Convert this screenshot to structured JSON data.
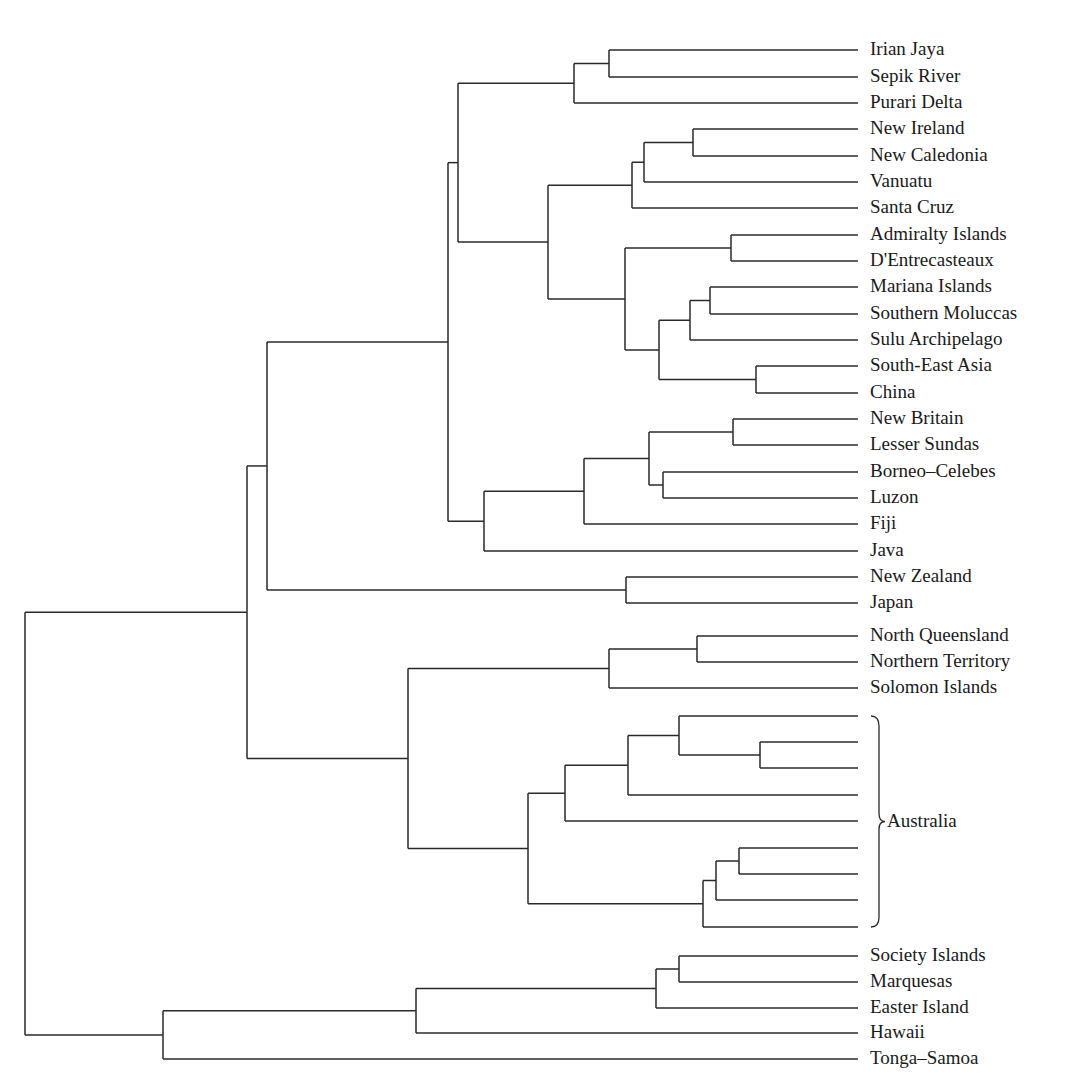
{
  "chart_data": {
    "type": "dendrogram",
    "title": "",
    "orientation": "leaves-right",
    "line_color": "#2a2a2a",
    "leaf_x": 858,
    "label_x": 870,
    "leaves": [
      {
        "id": "irian",
        "label": "Irian Jaya",
        "y": 50
      },
      {
        "id": "sepik",
        "label": "Sepik River",
        "y": 77
      },
      {
        "id": "purari",
        "label": "Purari Delta",
        "y": 103
      },
      {
        "id": "newireland",
        "label": "New Ireland",
        "y": 129
      },
      {
        "id": "newcaledonia",
        "label": "New Caledonia",
        "y": 156
      },
      {
        "id": "vanuatu",
        "label": "Vanuatu",
        "y": 182
      },
      {
        "id": "santacruz",
        "label": "Santa Cruz",
        "y": 208
      },
      {
        "id": "admiralty",
        "label": "Admiralty Islands",
        "y": 235
      },
      {
        "id": "dentre",
        "label": "D'Entrecasteaux",
        "y": 261
      },
      {
        "id": "mariana",
        "label": "Mariana Islands",
        "y": 287
      },
      {
        "id": "smoluccas",
        "label": "Southern Moluccas",
        "y": 314
      },
      {
        "id": "sulu",
        "label": "Sulu Archipelago",
        "y": 340
      },
      {
        "id": "seasia",
        "label": "South-East Asia",
        "y": 366
      },
      {
        "id": "china",
        "label": "China",
        "y": 393
      },
      {
        "id": "newbritain",
        "label": "New Britain",
        "y": 419
      },
      {
        "id": "lsundas",
        "label": "Lesser Sundas",
        "y": 445
      },
      {
        "id": "borneo",
        "label": "Borneo–Celebes",
        "y": 472
      },
      {
        "id": "luzon",
        "label": "Luzon",
        "y": 498
      },
      {
        "id": "fiji",
        "label": "Fiji",
        "y": 524
      },
      {
        "id": "java",
        "label": "Java",
        "y": 551
      },
      {
        "id": "nz",
        "label": "New Zealand",
        "y": 577
      },
      {
        "id": "japan",
        "label": "Japan",
        "y": 603
      },
      {
        "id": "nqld",
        "label": "North Queensland",
        "y": 636
      },
      {
        "id": "nt",
        "label": "Northern Territory",
        "y": 662
      },
      {
        "id": "solomon",
        "label": "Solomon Islands",
        "y": 688
      },
      {
        "id": "au1",
        "label": "",
        "y": 716
      },
      {
        "id": "au2",
        "label": "",
        "y": 742
      },
      {
        "id": "au3",
        "label": "",
        "y": 768
      },
      {
        "id": "au4",
        "label": "",
        "y": 795
      },
      {
        "id": "au5",
        "label": "",
        "y": 821
      },
      {
        "id": "au6",
        "label": "",
        "y": 848
      },
      {
        "id": "au7",
        "label": "",
        "y": 874
      },
      {
        "id": "au8",
        "label": "",
        "y": 900
      },
      {
        "id": "au9",
        "label": "",
        "y": 927
      },
      {
        "id": "society",
        "label": "Society Islands",
        "y": 956
      },
      {
        "id": "marquesas",
        "label": "Marquesas",
        "y": 982
      },
      {
        "id": "easter",
        "label": "Easter Island",
        "y": 1008
      },
      {
        "id": "hawaii",
        "label": "Hawaii",
        "y": 1033
      },
      {
        "id": "tonga",
        "label": "Tonga–Samoa",
        "y": 1059
      }
    ],
    "nodes": [
      {
        "id": "n_irian_sepik",
        "x": 609,
        "children": [
          "irian",
          "sepik"
        ]
      },
      {
        "id": "n_png",
        "x": 574,
        "children": [
          "n_irian_sepik",
          "purari"
        ]
      },
      {
        "id": "n_ni_nc",
        "x": 693,
        "children": [
          "newireland",
          "newcaledonia"
        ]
      },
      {
        "id": "n_van",
        "x": 644,
        "children": [
          "n_ni_nc",
          "vanuatu"
        ]
      },
      {
        "id": "n_sc",
        "x": 632,
        "children": [
          "n_van",
          "santacruz"
        ]
      },
      {
        "id": "n_adm_dent",
        "x": 731,
        "children": [
          "admiralty",
          "dentre"
        ]
      },
      {
        "id": "n_mar_smol",
        "x": 710,
        "children": [
          "mariana",
          "smoluccas"
        ]
      },
      {
        "id": "n_sulu",
        "x": 690,
        "children": [
          "n_mar_smol",
          "sulu"
        ]
      },
      {
        "id": "n_sea_china",
        "x": 756,
        "children": [
          "seasia",
          "china"
        ]
      },
      {
        "id": "n_asia",
        "x": 659,
        "children": [
          "n_sulu",
          "n_sea_china"
        ]
      },
      {
        "id": "n_adm_asia",
        "x": 625,
        "children": [
          "n_adm_dent",
          "n_asia"
        ]
      },
      {
        "id": "n_mel_mid",
        "x": 548,
        "children": [
          "n_sc",
          "n_adm_asia"
        ]
      },
      {
        "id": "n_top",
        "x": 458,
        "children": [
          "n_png",
          "n_mel_mid"
        ]
      },
      {
        "id": "n_nb_ls",
        "x": 733,
        "children": [
          "newbritain",
          "lsundas"
        ]
      },
      {
        "id": "n_bor_luz",
        "x": 663,
        "children": [
          "borneo",
          "luzon"
        ]
      },
      {
        "id": "n_nb_bor",
        "x": 649,
        "children": [
          "n_nb_ls",
          "n_bor_luz"
        ]
      },
      {
        "id": "n_fiji",
        "x": 584,
        "children": [
          "n_nb_bor",
          "fiji"
        ]
      },
      {
        "id": "n_java",
        "x": 484,
        "children": [
          "n_fiji",
          "java"
        ]
      },
      {
        "id": "n_melasia",
        "x": 448,
        "children": [
          "n_top",
          "n_java"
        ]
      },
      {
        "id": "n_nz_jp",
        "x": 626,
        "children": [
          "nz",
          "japan"
        ]
      },
      {
        "id": "n_upper",
        "x": 267,
        "children": [
          "n_melasia",
          "n_nz_jp"
        ]
      },
      {
        "id": "n_nq_nt",
        "x": 697,
        "children": [
          "nqld",
          "nt"
        ]
      },
      {
        "id": "n_sol",
        "x": 609,
        "children": [
          "n_nq_nt",
          "solomon"
        ]
      },
      {
        "id": "n_au23",
        "x": 760,
        "children": [
          "au2",
          "au3"
        ]
      },
      {
        "id": "n_au123",
        "x": 679,
        "children": [
          "au1",
          "n_au23"
        ]
      },
      {
        "id": "n_au1234",
        "x": 628,
        "children": [
          "n_au123",
          "au4"
        ]
      },
      {
        "id": "n_au12345",
        "x": 565,
        "children": [
          "n_au1234",
          "au5"
        ]
      },
      {
        "id": "n_au67",
        "x": 739,
        "children": [
          "au6",
          "au7"
        ]
      },
      {
        "id": "n_au678",
        "x": 716,
        "children": [
          "n_au67",
          "au8"
        ]
      },
      {
        "id": "n_au6789",
        "x": 703,
        "children": [
          "n_au678",
          "au9"
        ]
      },
      {
        "id": "n_aus",
        "x": 528,
        "children": [
          "n_au12345",
          "n_au6789"
        ]
      },
      {
        "id": "n_sahul",
        "x": 408,
        "children": [
          "n_sol",
          "n_aus"
        ]
      },
      {
        "id": "n_asia_pac",
        "x": 247,
        "children": [
          "n_upper",
          "n_sahul"
        ]
      },
      {
        "id": "n_soc_mar",
        "x": 679,
        "children": [
          "society",
          "marquesas"
        ]
      },
      {
        "id": "n_east",
        "x": 656,
        "children": [
          "n_soc_mar",
          "easter"
        ]
      },
      {
        "id": "n_haw",
        "x": 416,
        "children": [
          "n_east",
          "hawaii"
        ]
      },
      {
        "id": "n_poly",
        "x": 163,
        "children": [
          "n_haw",
          "tonga"
        ]
      },
      {
        "id": "root",
        "x": 25,
        "children": [
          "n_asia_pac",
          "n_poly"
        ]
      }
    ],
    "annotations": [
      {
        "type": "brace",
        "label": "Australia",
        "x": 871,
        "y_top": 716,
        "y_bottom": 927
      }
    ]
  },
  "annotations": {
    "australia_label": "Australia"
  }
}
